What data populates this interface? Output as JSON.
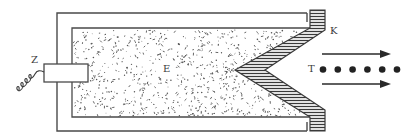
{
  "diagram": {
    "type": "schematic",
    "labels": {
      "plug": "Z",
      "explosive": "E",
      "liner": "K",
      "jet": "T"
    },
    "colors": {
      "stroke": "#4a4a4a",
      "background": "#ffffff",
      "speckle": "#555555",
      "dot": "#222222"
    },
    "jet_particle_count": 6,
    "arrow_count": 2
  }
}
